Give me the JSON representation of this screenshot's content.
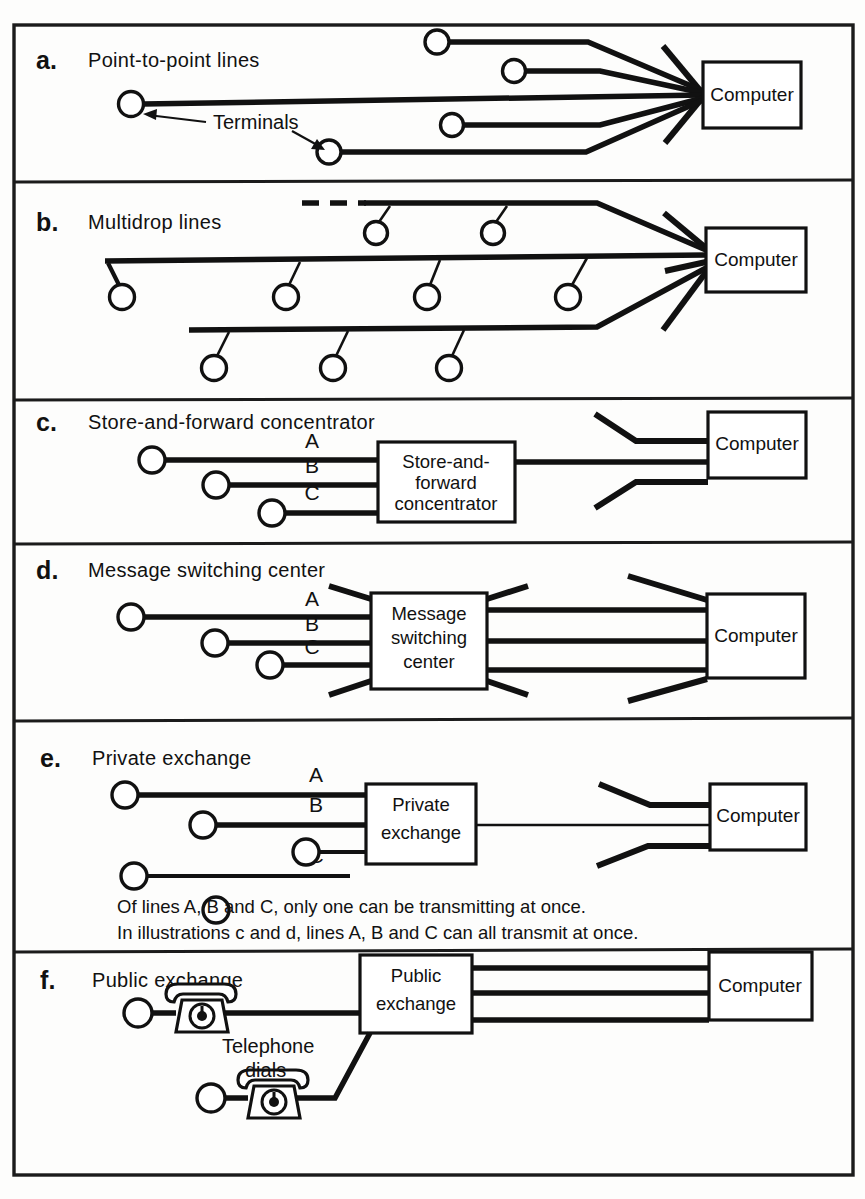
{
  "figure": {
    "kind": "technical-line-diagram",
    "background_color": "#fdfdfc",
    "ink_color": "#111111"
  },
  "panels": [
    {
      "letter": "a.",
      "title": "Point-to-point lines",
      "computer_label": "Computer",
      "annotation": "Terminals",
      "terminal_count": 5,
      "line_count": 7
    },
    {
      "letter": "b.",
      "title": "Multidrop lines",
      "computer_label": "Computer",
      "bus_count": 3,
      "terminal_count": 9
    },
    {
      "letter": "c.",
      "title": "Store-and-forward concentrator",
      "box_lines": [
        "Store-and-",
        "forward",
        "concentrator"
      ],
      "computer_label": "Computer",
      "line_labels": [
        "A",
        "B",
        "C"
      ],
      "terminal_count": 3
    },
    {
      "letter": "d.",
      "title": "Message switching center",
      "box_lines": [
        "Message",
        "switching",
        "center"
      ],
      "computer_label": "Computer",
      "line_labels": [
        "A",
        "B",
        "C"
      ],
      "terminal_count": 3
    },
    {
      "letter": "e.",
      "title": "Private exchange",
      "box_lines": [
        "Private",
        "exchange"
      ],
      "computer_label": "Computer",
      "line_labels": [
        "A",
        "B",
        "C"
      ],
      "terminal_count": 3,
      "notes": [
        "Of lines A, B and C, only one can be transmitting at once.",
        "In illustrations c and d, lines A, B and C can all transmit at once."
      ]
    },
    {
      "letter": "f.",
      "title": "Public exchange",
      "box_lines": [
        "Public",
        "exchange"
      ],
      "computer_label": "Computer",
      "annotation_lines": [
        "Telephone",
        "dials"
      ],
      "phone_count": 2
    }
  ]
}
